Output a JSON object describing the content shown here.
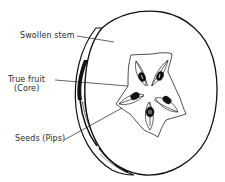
{
  "diagram": {
    "labels": [
      {
        "id": "swollen-stem",
        "text": "Swollen stem"
      },
      {
        "id": "true-fruit",
        "text": "True fruit",
        "subtext": "(Core)"
      },
      {
        "id": "seeds",
        "text": "Seeds (Pips)"
      }
    ],
    "colors": {
      "ink": "#1a1a1a",
      "background": "#ffffff"
    }
  }
}
